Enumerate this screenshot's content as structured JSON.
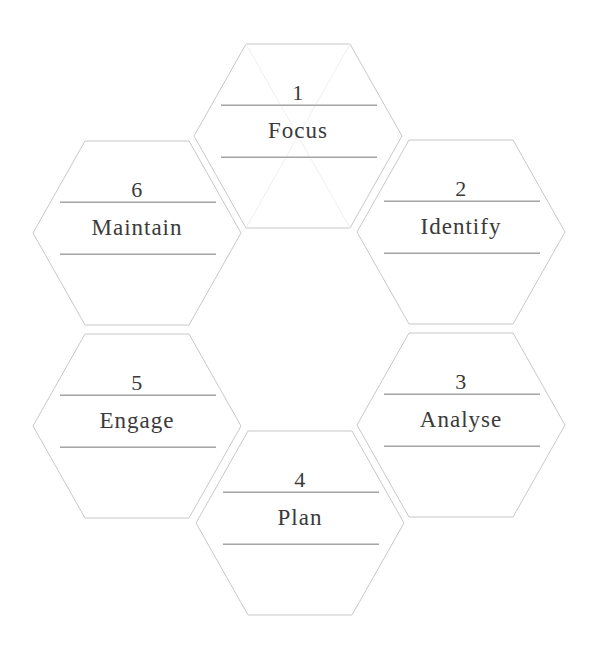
{
  "diagram": {
    "type": "hexagon-cycle",
    "colors": {
      "hex_border": "#c8c8c8",
      "text": "#3a3a3a",
      "rule": "#a6a6a6",
      "background": "#ffffff"
    },
    "steps": [
      {
        "number": "1",
        "label": "Focus"
      },
      {
        "number": "2",
        "label": "Identify"
      },
      {
        "number": "3",
        "label": "Analyse"
      },
      {
        "number": "4",
        "label": "Plan"
      },
      {
        "number": "5",
        "label": "Engage"
      },
      {
        "number": "6",
        "label": "Maintain"
      }
    ]
  }
}
